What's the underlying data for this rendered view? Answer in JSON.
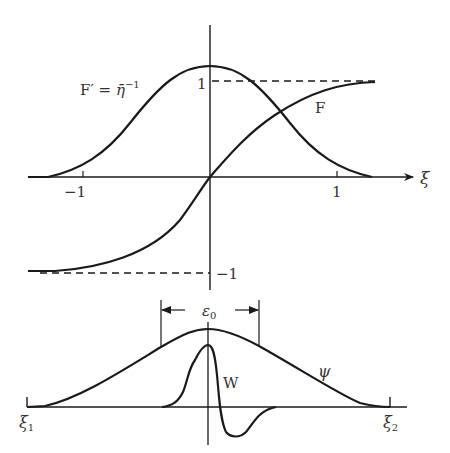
{
  "top_plot": {
    "axis_label_x": "ξ",
    "tick_labels": {
      "x_neg": "−1",
      "x_pos": "1",
      "y_pos": "1",
      "y_neg": "−1"
    },
    "curves": {
      "f_prime_label_main": "F′ = ",
      "f_prime_label_eta": "η̄",
      "f_prime_label_exp": "−1",
      "f_label": "F"
    }
  },
  "bottom_plot": {
    "width_label_main": "ε",
    "width_label_sub": "0",
    "psi_label": "ψ",
    "w_label": "W",
    "xi1_main": "ξ",
    "xi1_sub": "1",
    "xi2_main": "ξ",
    "xi2_sub": "2"
  },
  "colors": {
    "stroke": "#1a1a1a",
    "label": "#333333",
    "background": "#ffffff"
  }
}
